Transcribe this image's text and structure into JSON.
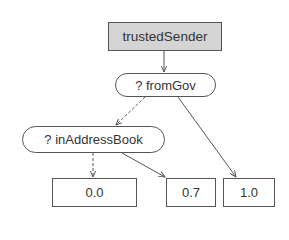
{
  "diagram": {
    "type": "decision-tree",
    "root": {
      "label": "trustedSender"
    },
    "decisions": [
      {
        "id": "fromGov",
        "label": "? fromGov"
      },
      {
        "id": "inAddressBook",
        "label": "? inAddressBook"
      }
    ],
    "leaves": [
      {
        "id": "leaf-0",
        "label": "0.0"
      },
      {
        "id": "leaf-1",
        "label": "0.7"
      },
      {
        "id": "leaf-2",
        "label": "1.0"
      }
    ],
    "edges": [
      {
        "from": "trustedSender",
        "to": "fromGov",
        "style": "solid"
      },
      {
        "from": "fromGov",
        "to": "inAddressBook",
        "style": "dashed",
        "meaning": "false"
      },
      {
        "from": "fromGov",
        "to": "leaf-2",
        "style": "solid",
        "meaning": "true"
      },
      {
        "from": "inAddressBook",
        "to": "leaf-0",
        "style": "dashed",
        "meaning": "false"
      },
      {
        "from": "inAddressBook",
        "to": "leaf-1",
        "style": "solid",
        "meaning": "true"
      }
    ],
    "colors": {
      "root_fill": "#d4d4d4",
      "stroke": "#555555",
      "text": "#333333"
    }
  }
}
